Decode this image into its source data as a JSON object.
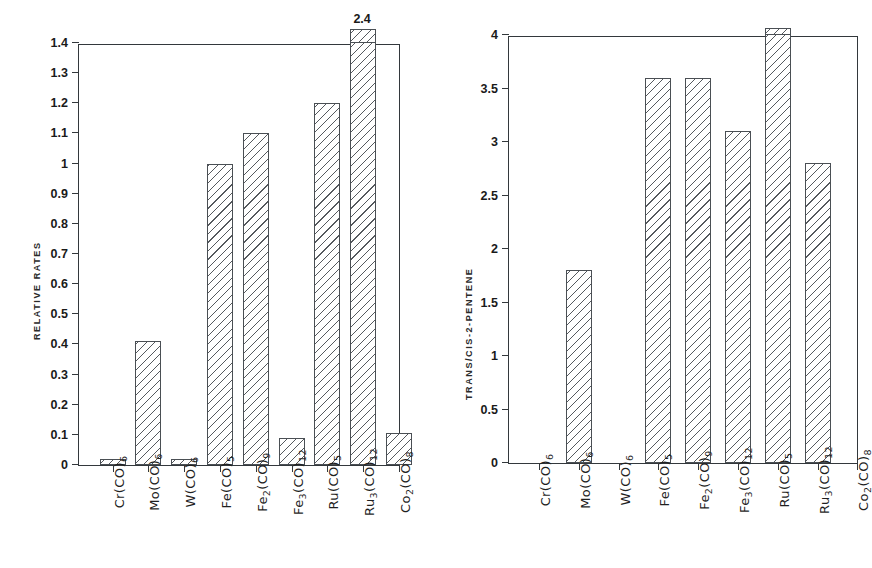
{
  "chart_data": [
    {
      "type": "bar",
      "panel": "left",
      "title": "",
      "xlabel": "",
      "ylabel": "RELATIVE RATES",
      "ylim": [
        0,
        1.4
      ],
      "ytick_labels": [
        "0",
        "0.1",
        "0.2",
        "0.3",
        "0.4",
        "0.5",
        "0.6",
        "0.7",
        "0.8",
        "0.9",
        "1",
        "1.1",
        "1.2",
        "1.3",
        "1.4"
      ],
      "ytick_values": [
        0,
        0.1,
        0.2,
        0.3,
        0.4,
        0.5,
        0.6,
        0.7,
        0.8,
        0.9,
        1.0,
        1.1,
        1.2,
        1.3,
        1.4
      ],
      "grid": false,
      "legend": "none",
      "categories": [
        {
          "formula": "Cr(CO)",
          "sub": "6"
        },
        {
          "formula": "Mo(CO)",
          "sub": "6"
        },
        {
          "formula": "W(CO)",
          "sub": "6"
        },
        {
          "formula": "Fe(CO)",
          "sub": "5"
        },
        {
          "formula": "Fe",
          "sub1": "2",
          "mid": "(CO)",
          "sub": "9"
        },
        {
          "formula": "Fe",
          "sub1": "3",
          "mid": "(CO)",
          "sub": "12"
        },
        {
          "formula": "Ru(CO)",
          "sub": "5"
        },
        {
          "formula": "Ru",
          "sub1": "3",
          "mid": "(CO)",
          "sub": "12"
        },
        {
          "formula": "Co",
          "sub1": "2",
          "mid": "(CO)",
          "sub": "8"
        }
      ],
      "category_labels": [
        "Cr(CO)6",
        "Mo(CO)6",
        "W(CO)6",
        "Fe(CO)5",
        "Fe2(CO)9",
        "Fe3(CO)12",
        "Ru(CO)5",
        "Ru3(CO)12",
        "Co2(CO)8"
      ],
      "values": [
        0.02,
        0.41,
        0.02,
        1.0,
        1.1,
        0.09,
        1.2,
        2.4,
        0.105
      ],
      "annotations": [
        {
          "index": 7,
          "text": "2.4",
          "note": "value exceeds axis maximum; bar clipped at top frame"
        }
      ]
    },
    {
      "type": "bar",
      "panel": "right",
      "title": "",
      "xlabel": "",
      "ylabel": "TRANS/CIS-2-PENTENE",
      "ylim": [
        0,
        4
      ],
      "ytick_labels": [
        "0",
        "0.5",
        "1",
        "1.5",
        "2",
        "2.5",
        "3",
        "3.5",
        "4"
      ],
      "ytick_values": [
        0,
        0.5,
        1,
        1.5,
        2,
        2.5,
        3,
        3.5,
        4
      ],
      "grid": false,
      "legend": "none",
      "categories": [
        {
          "formula": "Cr(CO)",
          "sub": "6"
        },
        {
          "formula": "Mo(CO)",
          "sub": "6"
        },
        {
          "formula": "W(CO)",
          "sub": "6"
        },
        {
          "formula": "Fe(CO)",
          "sub": "5"
        },
        {
          "formula": "Fe",
          "sub1": "2",
          "mid": "(CO)",
          "sub": "9"
        },
        {
          "formula": "Fe",
          "sub1": "3",
          "mid": "(CO)",
          "sub": "12"
        },
        {
          "formula": "Ru(CO)",
          "sub": "5"
        },
        {
          "formula": "Ru",
          "sub1": "3",
          "mid": "(CO)",
          "sub": "12"
        },
        {
          "formula": "Co",
          "sub1": "2",
          "mid": "(CO)",
          "sub": "8"
        }
      ],
      "category_labels": [
        "Cr(CO)6",
        "Mo(CO)6",
        "W(CO)6",
        "Fe(CO)5",
        "Fe2(CO)9",
        "Fe3(CO)12",
        "Ru(CO)5",
        "Ru3(CO)12",
        "Co2(CO)8"
      ],
      "values": [
        0,
        1.8,
        0,
        3.6,
        3.6,
        3.1,
        4.0,
        2.8,
        0
      ],
      "annotations": [
        {
          "index": 6,
          "text": "",
          "note": "bar reaches/exceeds axis maximum; clipped at top frame"
        }
      ]
    }
  ],
  "style": {
    "line_color": "#33383c",
    "bar_edge_color": "#4a4f54",
    "hatch_color": "#55595e",
    "background": "#ffffff",
    "text_color": "#1a1a1a"
  }
}
